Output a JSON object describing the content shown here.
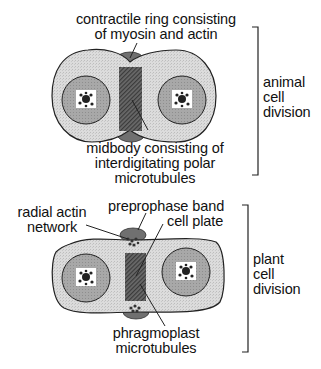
{
  "figure": {
    "animal": {
      "labels": {
        "contractile_ring": [
          "contractile ring consisting",
          "of myosin and actin"
        ],
        "midbody": [
          "midbody consisting of",
          "interdigitating polar",
          "microtubules"
        ],
        "bracket": [
          "animal",
          "cell",
          "division"
        ]
      }
    },
    "plant": {
      "labels": {
        "radial_actin": [
          "radial actin",
          "network"
        ],
        "preprophase_band": [
          "preprophase band"
        ],
        "cell_plate": [
          "cell plate"
        ],
        "phragmoplast": [
          "phragmoplast",
          "microtubules"
        ],
        "bracket": [
          "plant",
          "cell",
          "division"
        ]
      }
    },
    "colors": {
      "cytoplasm": "#d9d9d9",
      "nucleus": "#a9a9a9",
      "chromatin_bg": "#ffffff",
      "chromatin": "#222222",
      "midzone": "#5e5e5e",
      "ring": "#7a7a7a",
      "outline": "#222222"
    }
  }
}
